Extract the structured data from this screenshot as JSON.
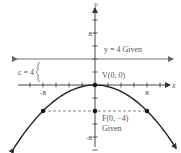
{
  "diagram": {
    "type": "parabola-focus-directrix",
    "equation": "x^2 = -16y",
    "axes": {
      "x_label": "x",
      "y_label": "y",
      "x_ticks": [
        -8,
        8
      ],
      "y_ticks": [
        8,
        -8
      ],
      "tick_step": 2,
      "x_range": [
        -14,
        14
      ],
      "y_range": [
        -11,
        13
      ]
    },
    "directrix": {
      "y": 4,
      "label": "y = 4 Given"
    },
    "vertex": {
      "x": 0,
      "y": 0,
      "label": "V(0, 0)"
    },
    "focus": {
      "x": 0,
      "y": -4,
      "label": "F(0, −4)",
      "sublabel": "Given"
    },
    "latus_rectum_points": [
      {
        "x": -8,
        "y": -4
      },
      {
        "x": 8,
        "y": -4
      }
    ],
    "c_label": "c = 4",
    "parabola_a": -0.0625,
    "parabola_x_extent": [
      -12.5,
      12.5
    ]
  },
  "labels": {
    "x_tick_neg8": "-8",
    "x_tick_8": "8",
    "y_tick_8": "8",
    "y_tick_neg8": "-8"
  }
}
